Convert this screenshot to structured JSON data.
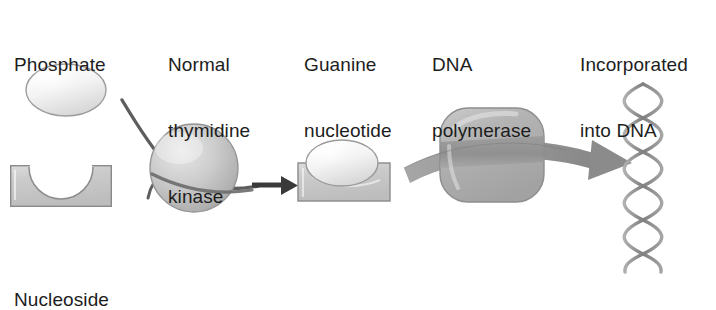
{
  "figure": {
    "background": "#ffffff",
    "text_color": "#1d1d1d",
    "palette": {
      "block_fill": "#c9c9c9",
      "block_edge": "#8a8a8a",
      "sphere_fill": "#c2c2c2",
      "sphere_edge": "#8f8f8f",
      "ellipse_fill": "#f2f2f2",
      "ellipse_edge": "#9a9a9a",
      "polymerase_fill": "#b9b9b9",
      "polymerase_band": "#8e8e8e",
      "ribbon_arrow": "#999999",
      "thin_arrow": "#4a4a4a",
      "helix_strand": "#8c8c8c"
    }
  },
  "labels": {
    "phosphate": {
      "lines": [
        "Phosphate"
      ]
    },
    "thymidine_kinase": {
      "lines": [
        "Normal",
        "thymidine",
        "kinase"
      ]
    },
    "guanine_nucleotide": {
      "lines": [
        "Guanine",
        "nucleotide"
      ]
    },
    "dna_polymerase": {
      "lines": [
        "DNA",
        "polymerase"
      ]
    },
    "incorporated": {
      "lines": [
        "Incorporated",
        "into DNA"
      ]
    },
    "nucleoside": {
      "lines": [
        "Nucleoside"
      ]
    }
  },
  "shapes": {
    "phosphate_ellipse": {
      "name": "phosphate-ellipse",
      "cx": 66,
      "cy": 90,
      "rx": 40,
      "ry": 26
    },
    "nucleoside_block": {
      "name": "nucleoside-block",
      "x": 10,
      "y": 165,
      "width": 102,
      "height": 42,
      "notch_radius": 32
    },
    "kinase_sphere": {
      "name": "kinase-sphere",
      "cx": 194,
      "cy": 168,
      "r": 44
    },
    "product_block": {
      "name": "guanine-nucleotide-block",
      "x": 298,
      "y": 163,
      "width": 92,
      "height": 38
    },
    "product_ellipse": {
      "name": "guanine-nucleotide-ellipse",
      "cx": 342,
      "cy": 163,
      "rx": 36,
      "ry": 23
    },
    "polymerase_body": {
      "name": "dna-polymerase-body",
      "x": 440,
      "y": 108,
      "width": 104,
      "height": 94,
      "corner_radius": 28
    },
    "dna_helix": {
      "name": "dna-double-helix",
      "x": 640,
      "y": 82,
      "width": 26,
      "height": 192,
      "turns": 9
    }
  },
  "arrows": {
    "kinase_curve": {
      "name": "kinase-reaction-arrow",
      "direction": "left-to-right"
    },
    "product_arrow": {
      "name": "product-arrow",
      "direction": "right"
    },
    "polymerase_ribbon": {
      "name": "polymerase-incorporation-arrow",
      "direction": "right"
    }
  }
}
